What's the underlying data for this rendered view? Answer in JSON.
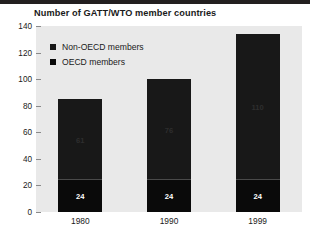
{
  "chart_data": {
    "type": "bar",
    "subtype": "stacked-bar",
    "title": "Number of GATT/WTO member countries",
    "xlabel": "",
    "ylabel": "",
    "categories": [
      "1980",
      "1990",
      "1999"
    ],
    "series": [
      {
        "name": "OECD members",
        "values": [
          24,
          24,
          24
        ],
        "color": "#0a0a0a"
      },
      {
        "name": "Non-OECD members",
        "values": [
          61,
          76,
          110
        ],
        "color": "#181818"
      }
    ],
    "totals": [
      86,
      100,
      134
    ],
    "ylim": [
      0,
      140
    ],
    "yticks": [
      0,
      20,
      40,
      60,
      80,
      100,
      120,
      140
    ],
    "ytick_labels": [
      "0",
      "20",
      "40",
      "60",
      "80",
      "100",
      "120",
      "140"
    ],
    "grid": false,
    "legend_position": "upper-left",
    "plot_background": "#e9e9e9",
    "stack_order": [
      "OECD members",
      "Non-OECD members"
    ],
    "bar_labels": {
      "non_oecd": [
        "61",
        "76",
        "110"
      ],
      "oecd": [
        "24",
        "24",
        "24"
      ]
    }
  },
  "legend": {
    "items": [
      {
        "label": "Non-OECD members",
        "swatch_color": "#181818"
      },
      {
        "label": "OECD members",
        "swatch_color": "#0a0a0a"
      }
    ]
  }
}
